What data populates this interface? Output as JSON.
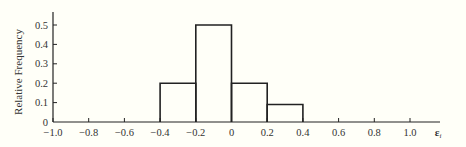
{
  "chart_data": {
    "type": "bar",
    "subtype": "histogram",
    "title": "",
    "xlabel": "ε_i",
    "ylabel": "Relative Frequency",
    "bins": [
      {
        "from": -0.4,
        "to": -0.2,
        "value": 0.2
      },
      {
        "from": -0.2,
        "to": 0.0,
        "value": 0.5
      },
      {
        "from": 0.0,
        "to": 0.2,
        "value": 0.2
      },
      {
        "from": 0.2,
        "to": 0.4,
        "value": 0.09
      }
    ],
    "categories": [
      "-0.4 to -0.2",
      "-0.2 to 0",
      "0 to 0.2",
      "0.2 to 0.4"
    ],
    "values": [
      0.2,
      0.5,
      0.2,
      0.09
    ],
    "xlim": [
      -1.0,
      1.0
    ],
    "ylim": [
      0,
      0.55
    ],
    "x_ticks": [
      "-1.0",
      "-0.8",
      "-0.6",
      "-0.4",
      "-0.2",
      "0",
      "0.2",
      "0.4",
      "0.6",
      "0.8",
      "1.0"
    ],
    "x_tick_values": [
      -1.0,
      -0.8,
      -0.6,
      -0.4,
      -0.2,
      0,
      0.2,
      0.4,
      0.6,
      0.8,
      1.0
    ],
    "y_ticks": [
      "0",
      "0.1",
      "0.2",
      "0.3",
      "0.4",
      "0.5"
    ],
    "y_tick_values": [
      0,
      0.1,
      0.2,
      0.3,
      0.4,
      0.5
    ],
    "grid": false,
    "legend": null,
    "colors": {
      "line": "#222222",
      "background": "#fffff8",
      "text": "#333333"
    }
  },
  "labels": {
    "ylabel": "Relative Frequency",
    "xlabel_main": "ε",
    "xlabel_sub": "i"
  }
}
